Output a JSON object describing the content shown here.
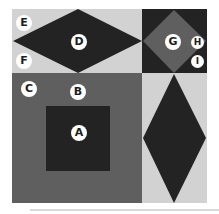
{
  "diagram": {
    "colors": {
      "light": "#d2d2d2",
      "mid": "#5f5f5f",
      "dark": "#232323",
      "label_bg": "#ffffff",
      "label_text": "#1e1e1e"
    },
    "labels": {
      "A": "A",
      "B": "B",
      "C": "C",
      "D": "D",
      "E": "E",
      "F": "F",
      "G": "G",
      "H": "H",
      "I": "I"
    }
  }
}
